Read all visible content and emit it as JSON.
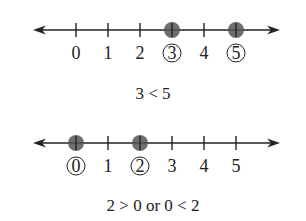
{
  "diagrams": [
    {
      "title": "Number line 1",
      "tick_labels": [
        "0",
        "1",
        "2",
        "3",
        "4",
        "5"
      ],
      "highlighted": [
        "3",
        "5"
      ],
      "caption": "3 < 5"
    },
    {
      "title": "Number line 2",
      "tick_labels": [
        "0",
        "1",
        "2",
        "3",
        "4",
        "5"
      ],
      "highlighted": [
        "0",
        "2"
      ],
      "caption": "2 > 0  or  0 < 2"
    }
  ],
  "colors": {
    "line": "#222222",
    "dot": "#555555"
  }
}
